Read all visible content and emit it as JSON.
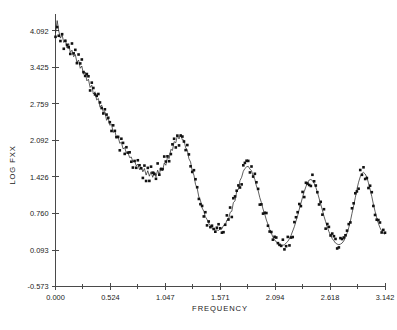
{
  "chart_data": {
    "type": "scatter",
    "title": "",
    "subtitle": "",
    "xlabel": "FREQUENCY",
    "ylabel": "LOG FXX",
    "xlim": [
      0.0,
      3.142
    ],
    "ylim": [
      -0.573,
      4.4
    ],
    "xticks": [
      0.0,
      0.524,
      1.047,
      1.571,
      2.094,
      2.618,
      3.142
    ],
    "xtick_labels": [
      "0.000",
      "0.524",
      "1.047",
      "1.571",
      "2.094",
      "2.618",
      "3.142"
    ],
    "yticks": [
      -0.573,
      0.093,
      0.76,
      1.426,
      2.092,
      2.759,
      3.425,
      4.092
    ],
    "ytick_labels": [
      "-0.573",
      "0.093",
      "0.760",
      "1.426",
      "2.092",
      "2.759",
      "3.425",
      "4.092"
    ],
    "grid": false,
    "legend": "none",
    "marker_style": "filled-square",
    "line_style": "solid-thin-connecting",
    "series": [
      {
        "name": "log spectral density",
        "x": [
          0.0,
          0.016,
          0.031,
          0.047,
          0.063,
          0.079,
          0.094,
          0.11,
          0.126,
          0.141,
          0.157,
          0.173,
          0.189,
          0.204,
          0.22,
          0.236,
          0.251,
          0.267,
          0.283,
          0.299,
          0.314,
          0.33,
          0.346,
          0.361,
          0.377,
          0.393,
          0.409,
          0.424,
          0.44,
          0.456,
          0.471,
          0.487,
          0.503,
          0.518,
          0.534,
          0.55,
          0.566,
          0.581,
          0.597,
          0.613,
          0.628,
          0.644,
          0.66,
          0.676,
          0.691,
          0.707,
          0.723,
          0.738,
          0.754,
          0.77,
          0.785,
          0.801,
          0.817,
          0.833,
          0.848,
          0.864,
          0.88,
          0.895,
          0.911,
          0.927,
          0.943,
          0.958,
          0.974,
          0.99,
          1.005,
          1.021,
          1.037,
          1.052,
          1.068,
          1.084,
          1.1,
          1.115,
          1.131,
          1.147,
          1.162,
          1.178,
          1.194,
          1.21,
          1.225,
          1.241,
          1.257,
          1.272,
          1.288,
          1.304,
          1.32,
          1.335,
          1.351,
          1.367,
          1.382,
          1.398,
          1.414,
          1.429,
          1.445,
          1.461,
          1.477,
          1.492,
          1.508,
          1.524,
          1.539,
          1.555,
          1.571,
          1.587,
          1.602,
          1.618,
          1.634,
          1.649,
          1.665,
          1.681,
          1.696,
          1.712,
          1.728,
          1.744,
          1.759,
          1.775,
          1.791,
          1.806,
          1.822,
          1.838,
          1.854,
          1.869,
          1.885,
          1.901,
          1.916,
          1.932,
          1.948,
          1.963,
          1.979,
          1.995,
          2.011,
          2.026,
          2.042,
          2.058,
          2.073,
          2.089,
          2.105,
          2.121,
          2.136,
          2.152,
          2.168,
          2.183,
          2.199,
          2.215,
          2.231,
          2.246,
          2.262,
          2.278,
          2.293,
          2.309,
          2.325,
          2.34,
          2.356,
          2.372,
          2.388,
          2.403,
          2.419,
          2.435,
          2.45,
          2.466,
          2.482,
          2.497,
          2.513,
          2.529,
          2.545,
          2.56,
          2.576,
          2.592,
          2.607,
          2.623,
          2.639,
          2.655,
          2.67,
          2.686,
          2.702,
          2.717,
          2.733,
          2.749,
          2.765,
          2.78,
          2.796,
          2.812,
          2.827,
          2.843,
          2.859,
          2.874,
          2.89,
          2.906,
          2.922,
          2.937,
          2.953,
          2.969,
          2.984,
          3.0,
          3.016,
          3.031,
          3.047,
          3.063,
          3.079,
          3.094,
          3.11,
          3.126,
          3.142
        ],
        "y": [
          4.05,
          4.28,
          4.09,
          3.96,
          4.02,
          3.88,
          3.93,
          3.78,
          3.86,
          3.7,
          3.74,
          3.62,
          3.66,
          3.52,
          3.56,
          3.41,
          3.45,
          3.3,
          3.34,
          3.18,
          3.21,
          3.06,
          3.1,
          2.94,
          2.98,
          2.83,
          2.86,
          2.7,
          2.74,
          2.6,
          2.62,
          2.46,
          2.5,
          2.37,
          2.39,
          2.24,
          2.27,
          2.14,
          2.16,
          2.04,
          2.06,
          1.94,
          1.96,
          1.86,
          1.87,
          1.78,
          1.79,
          1.7,
          1.72,
          1.63,
          1.66,
          1.56,
          1.61,
          1.52,
          1.58,
          1.46,
          1.54,
          1.44,
          1.52,
          1.42,
          1.52,
          1.43,
          1.55,
          1.47,
          1.6,
          1.54,
          1.68,
          1.64,
          1.79,
          1.76,
          1.93,
          1.91,
          2.07,
          2.05,
          2.18,
          2.12,
          2.2,
          2.1,
          2.1,
          1.96,
          1.92,
          1.76,
          1.7,
          1.53,
          1.46,
          1.29,
          1.22,
          1.06,
          1.0,
          0.86,
          0.8,
          0.7,
          0.65,
          0.58,
          0.54,
          0.5,
          0.48,
          0.46,
          0.46,
          0.45,
          0.48,
          0.48,
          0.54,
          0.54,
          0.64,
          0.64,
          0.78,
          0.8,
          0.96,
          0.99,
          1.16,
          1.2,
          1.36,
          1.42,
          1.53,
          1.58,
          1.61,
          1.62,
          1.57,
          1.54,
          1.44,
          1.38,
          1.26,
          1.18,
          1.05,
          0.96,
          0.84,
          0.75,
          0.64,
          0.56,
          0.47,
          0.4,
          0.33,
          0.28,
          0.24,
          0.21,
          0.19,
          0.18,
          0.18,
          0.19,
          0.22,
          0.25,
          0.3,
          0.36,
          0.44,
          0.52,
          0.62,
          0.72,
          0.84,
          0.94,
          1.06,
          1.16,
          1.25,
          1.32,
          1.37,
          1.38,
          1.36,
          1.31,
          1.24,
          1.15,
          1.04,
          0.93,
          0.82,
          0.71,
          0.61,
          0.51,
          0.43,
          0.36,
          0.3,
          0.26,
          0.22,
          0.2,
          0.19,
          0.2,
          0.22,
          0.26,
          0.32,
          0.4,
          0.5,
          0.62,
          0.76,
          0.9,
          1.05,
          1.2,
          1.33,
          1.43,
          1.49,
          1.51,
          1.48,
          1.42,
          1.32,
          1.2,
          1.07,
          0.93,
          0.8,
          0.68,
          0.58,
          0.5,
          0.44,
          0.4,
          0.38
        ],
        "y_scatter_band": 0.13
      }
    ]
  },
  "axes": {
    "x_axis_name": "frequency-axis",
    "y_axis_name": "log-fxx-axis"
  }
}
